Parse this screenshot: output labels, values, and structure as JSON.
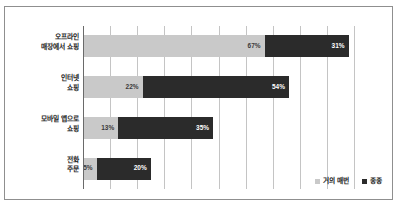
{
  "chart_data": {
    "type": "bar",
    "orientation": "horizontal",
    "stacked": true,
    "title": "",
    "subtitle": "",
    "xlabel": "",
    "ylabel": "",
    "xlim": [
      0,
      100
    ],
    "grid": true,
    "gridline_count": 10,
    "legend_position": "bottom-right",
    "categories": [
      "오프라인\n매장에서 쇼핑",
      "인터넷\n쇼핑",
      "모바일 앱으로\n쇼핑",
      "전화\n주문"
    ],
    "series": [
      {
        "name": "거의 매번",
        "color": "#c9c9c9",
        "values": [
          67,
          22,
          13,
          5
        ],
        "labels": [
          "67%",
          "22%",
          "13%",
          "5%"
        ]
      },
      {
        "name": "종종",
        "color": "#2b2b2b",
        "values": [
          31,
          54,
          35,
          20
        ],
        "labels": [
          "31%",
          "54%",
          "35%",
          "20%"
        ]
      }
    ]
  },
  "legend": {
    "items": [
      {
        "label": "거의 매번",
        "color": "#c9c9c9"
      },
      {
        "label": "종종",
        "color": "#2b2b2b"
      }
    ]
  }
}
